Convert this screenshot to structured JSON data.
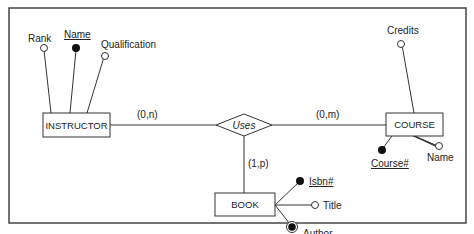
{
  "diagram": {
    "type": "entity-relationship",
    "entities": [
      {
        "id": "instructor",
        "label": "INSTRUCTOR"
      },
      {
        "id": "course",
        "label": "COURSE"
      },
      {
        "id": "book",
        "label": "BOOK"
      }
    ],
    "relationship": {
      "label": "Uses"
    },
    "cardinalities": {
      "instructor": "(0,n)",
      "course": "(0,m)",
      "book": "(1,p)"
    },
    "attributes": {
      "instructor": [
        {
          "label": "Rank",
          "kind": "simple"
        },
        {
          "label": "Name",
          "kind": "key"
        },
        {
          "label": "Qualification",
          "kind": "simple"
        }
      ],
      "course": [
        {
          "label": "Credits",
          "kind": "simple"
        },
        {
          "label": "Course#",
          "kind": "key"
        },
        {
          "label": "Name",
          "kind": "simple"
        }
      ],
      "book": [
        {
          "label": "Isbn#",
          "kind": "key"
        },
        {
          "label": "Title",
          "kind": "simple"
        },
        {
          "label": "Author",
          "kind": "multivalued"
        }
      ]
    },
    "colors": {
      "line": "#333333",
      "frame": "#444444",
      "fill": "#ffffff",
      "key_fill": "#111111"
    }
  }
}
